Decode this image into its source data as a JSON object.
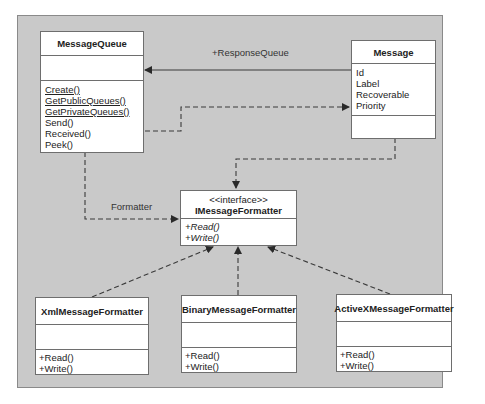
{
  "diagram": {
    "type": "UML class diagram",
    "classes": {
      "message_queue": {
        "name": "MessageQueue",
        "attributes": [],
        "methods": [
          {
            "label": "Create()",
            "static": true
          },
          {
            "label": "GetPublicQueues()",
            "static": true
          },
          {
            "label": "GetPrivateQueues()",
            "static": true
          },
          {
            "label": "Send()",
            "static": false
          },
          {
            "label": "Received()",
            "static": false
          },
          {
            "label": "Peek()",
            "static": false
          }
        ]
      },
      "message": {
        "name": "Message",
        "attributes": [
          "Id",
          "Label",
          "Recoverable",
          "Priority"
        ],
        "methods": []
      },
      "imessage_formatter": {
        "stereotype": "<<interface>>",
        "name": "IMessageFormatter",
        "methods": [
          "+Read()",
          "+Write()"
        ]
      },
      "xml_formatter": {
        "name": "XmlMessageFormatter",
        "attributes": [],
        "methods": [
          "+Read()",
          "+Write()"
        ]
      },
      "binary_formatter": {
        "name": "BinaryMessageFormatter",
        "attributes": [],
        "methods": [
          "+Read()",
          "+Write()"
        ]
      },
      "activex_formatter": {
        "name": "ActiveXMessageFormatter",
        "attributes": [],
        "methods": [
          "+Read()",
          "+Write()"
        ]
      }
    },
    "relationships": [
      {
        "from": "Message",
        "to": "MessageQueue",
        "kind": "association",
        "label": "+ResponseQueue"
      },
      {
        "from": "MessageQueue",
        "to": "Message",
        "kind": "dependency",
        "label": ""
      },
      {
        "from": "MessageQueue",
        "to": "IMessageFormatter",
        "kind": "dependency",
        "label": "Formatter"
      },
      {
        "from": "Message",
        "to": "IMessageFormatter",
        "kind": "dependency",
        "label": ""
      },
      {
        "from": "XmlMessageFormatter",
        "to": "IMessageFormatter",
        "kind": "realization",
        "label": ""
      },
      {
        "from": "BinaryMessageFormatter",
        "to": "IMessageFormatter",
        "kind": "realization",
        "label": ""
      },
      {
        "from": "ActiveXMessageFormatter",
        "to": "IMessageFormatter",
        "kind": "realization",
        "label": ""
      }
    ],
    "labels": {
      "response_queue": "+ResponseQueue",
      "formatter": "Formatter"
    },
    "colors": {
      "panel": "#c9c9c9",
      "box": "#ffffff",
      "line": "#3a3a3a"
    }
  }
}
